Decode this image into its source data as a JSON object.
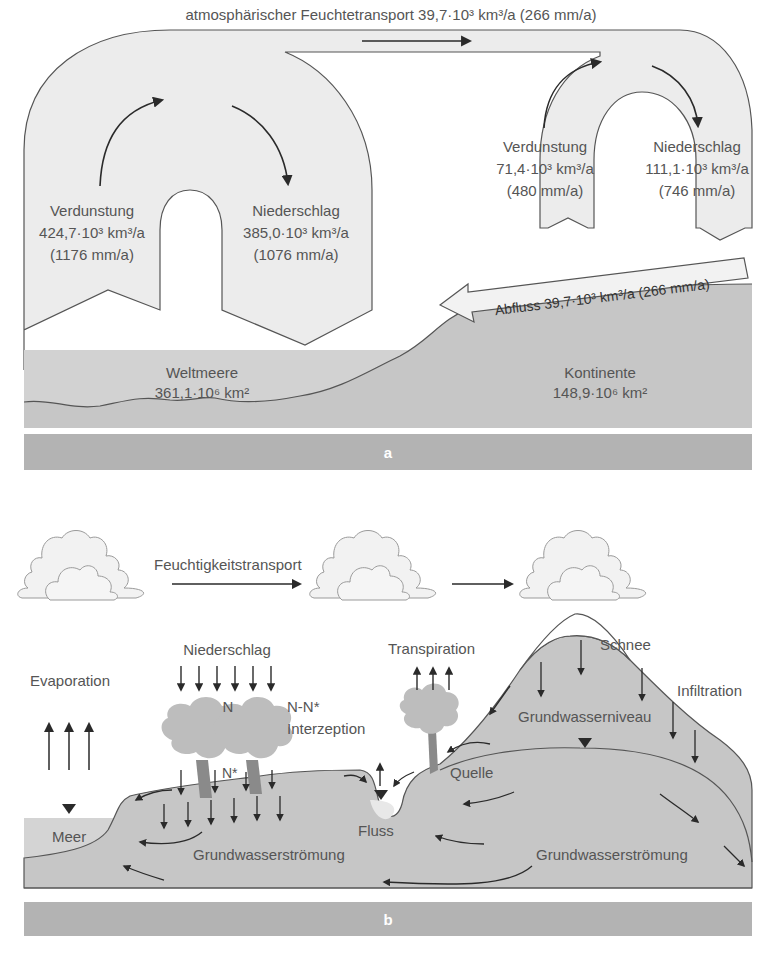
{
  "panel_a": {
    "letter": "a",
    "top_title": "atmosphärischer Feuchtetransport 39,7·10³ km³/a (266 mm/a)",
    "ocean_evaporation": {
      "label": "Verdunstung",
      "volume": "424,7·10³ km³/a",
      "depth": "(1176 mm/a)"
    },
    "ocean_precipitation": {
      "label": "Niederschlag",
      "volume": "385,0·10³ km³/a",
      "depth": "(1076 mm/a)"
    },
    "land_evaporation": {
      "label": "Verdunstung",
      "volume": "71,4·10³ km³/a",
      "depth": "(480 mm/a)"
    },
    "land_precipitation": {
      "label": "Niederschlag",
      "volume": "111,1·10³ km³/a",
      "depth": "(746 mm/a)"
    },
    "runoff": "Abfluss 39,7·10³ km³/a (266 mm/a)",
    "oceans": {
      "label": "Weltmeere",
      "area": "361,1·10⁶ km²"
    },
    "continents": {
      "label": "Kontinente",
      "area": "148,9·10⁶ km²"
    }
  },
  "panel_b": {
    "letter": "b",
    "moisture_transport": "Feuchtigkeitstransport",
    "precipitation": "Niederschlag",
    "n": "N",
    "n_minus_nstar": "N-N*",
    "interception": "Interzeption",
    "n_star": "N*",
    "evaporation": "Evaporation",
    "transpiration": "Transpiration",
    "snow": "Schnee",
    "infiltration": "Infiltration",
    "groundwater_level": "Grundwasserniveau",
    "spring": "Quelle",
    "sea": "Meer",
    "river": "Fluss",
    "groundwater_flow_left": "Grundwasserströmung",
    "groundwater_flow_right": "Grundwasserströmung"
  },
  "colors": {
    "flow_fill": "#ececec",
    "ground": "#c4c4c4",
    "sea": "#cfcfcf",
    "band": "#b3b3b3",
    "outline": "#555555",
    "arrow": "#2a2a2a",
    "tree": "#bdbdbd",
    "trunk": "#8a8a8a"
  }
}
